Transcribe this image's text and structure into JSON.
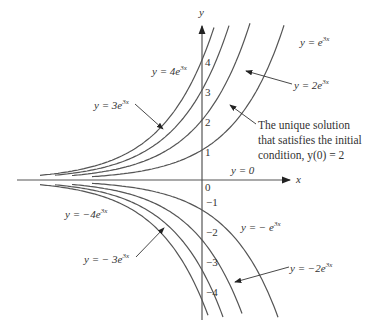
{
  "figure": {
    "axis_x_label": "x",
    "axis_y_label": "y",
    "origin_label": "0",
    "y_ticks_positive": [
      "1",
      "2",
      "3",
      "4"
    ],
    "y_ticks_negative": [
      "−1",
      "−2",
      "−3",
      "−4"
    ],
    "zero_solution_label": "y = 0",
    "curve_labels": {
      "c1": "y = e",
      "c2": "y = 2e",
      "c3": "y = 3e",
      "c4": "y = 4e",
      "cm1": "y = − e",
      "cm2": "y = −2e",
      "cm3": "y = − 3e",
      "cm4": "y = −4e"
    },
    "exponent": "3x",
    "note_lines": [
      "The unique solution",
      "that satisfies the initial",
      "condition,  y(0) = 2"
    ],
    "line_color": "#555555"
  },
  "chart_data": {
    "type": "line",
    "xlabel": "x",
    "ylabel": "y",
    "ylim": [
      -5,
      5
    ],
    "series": [
      {
        "name": "y = 4e^{3x}",
        "C": 4
      },
      {
        "name": "y = 3e^{3x}",
        "C": 3
      },
      {
        "name": "y = 2e^{3x}",
        "C": 2
      },
      {
        "name": "y = e^{3x}",
        "C": 1
      },
      {
        "name": "y = 0",
        "C": 0
      },
      {
        "name": "y = -e^{3x}",
        "C": -1
      },
      {
        "name": "y = -2e^{3x}",
        "C": -2
      },
      {
        "name": "y = -3e^{3x}",
        "C": -3
      },
      {
        "name": "y = -4e^{3x}",
        "C": -4
      }
    ],
    "annotation": "The unique solution that satisfies the initial condition, y(0) = 2"
  }
}
